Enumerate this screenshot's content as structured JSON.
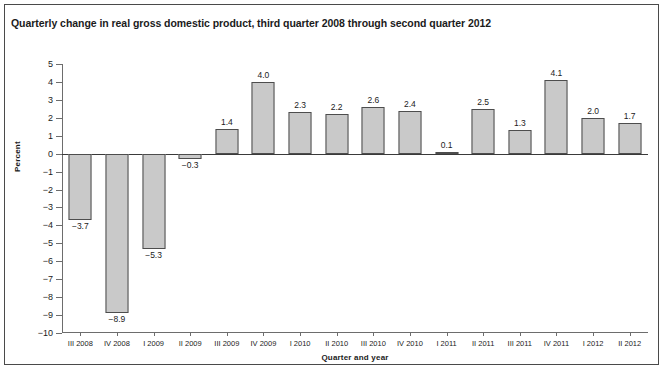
{
  "figure": {
    "title": "Quarterly change in real gross domestic product, third quarter 2008 through second quarter 2012"
  },
  "chart_data": {
    "type": "bar",
    "title": "Quarterly change in real gross domestic product, third quarter 2008 through second quarter 2012",
    "xlabel": "Quarter and year",
    "ylabel": "Percent",
    "ylim": [
      -10,
      5
    ],
    "yticks": [
      5,
      4,
      3,
      2,
      1,
      0,
      -1,
      -2,
      -3,
      -4,
      -5,
      -6,
      -7,
      -8,
      -9,
      -10
    ],
    "ytick_labels": [
      "5",
      "4",
      "3",
      "2",
      "1",
      "0",
      "−1",
      "−2",
      "−3",
      "−4",
      "−5",
      "−6",
      "−7",
      "−8",
      "−9",
      "−10"
    ],
    "grid": false,
    "legend": "none",
    "categories": [
      "III 2008",
      "IV 2008",
      "I 2009",
      "II 2009",
      "III 2009",
      "IV 2009",
      "I 2010",
      "II 2010",
      "III 2010",
      "IV 2010",
      "I 2011",
      "II 2011",
      "III 2011",
      "IV 2011",
      "I 2012",
      "II 2012"
    ],
    "values": [
      -3.7,
      -8.9,
      -5.3,
      -0.3,
      1.4,
      4.0,
      2.3,
      2.2,
      2.6,
      2.4,
      0.1,
      2.5,
      1.3,
      4.1,
      2.0,
      1.7
    ],
    "value_labels": [
      "−3.7",
      "−8.9",
      "−5.3",
      "−0.3",
      "1.4",
      "4.0",
      "2.3",
      "2.2",
      "2.6",
      "2.4",
      "0.1",
      "2.5",
      "1.3",
      "4.1",
      "2.0",
      "1.7"
    ],
    "bar_fill": "#c9c9c9",
    "bar_edge": "#4d4d4d"
  }
}
